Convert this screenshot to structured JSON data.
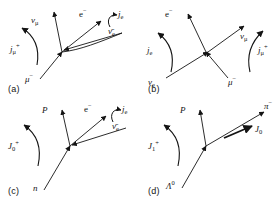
{
  "figure": {
    "type": "physics-feynman-current-diagram-grid",
    "background": "#ffffff",
    "ink": "#141414",
    "panel_count": 4
  },
  "panels": [
    {
      "id": "a",
      "tag": "(a)",
      "current_label": "j",
      "current_sub": "μ",
      "current_sup": "+",
      "labels": [
        {
          "name": "nu-mu",
          "text": "ν",
          "sub": "μ",
          "sup": ""
        },
        {
          "name": "electron",
          "text": "e",
          "sub": "",
          "sup": "−"
        },
        {
          "name": "current-je",
          "text": "j",
          "sub": "e",
          "sup": ""
        },
        {
          "name": "antineutrino",
          "text": "ν̄",
          "sub": "e",
          "sup": ""
        },
        {
          "name": "muon",
          "text": "μ",
          "sub": "",
          "sup": "−"
        }
      ]
    },
    {
      "id": "b",
      "tag": "(b)",
      "current_label": "j",
      "current_sub": "e",
      "current_sup": "",
      "current2_label": "j",
      "current2_sub": "μ",
      "current2_sup": "+",
      "labels": [
        {
          "name": "electron",
          "text": "e",
          "sub": "",
          "sup": "−"
        },
        {
          "name": "nu-mu",
          "text": "ν",
          "sub": "μ",
          "sup": ""
        },
        {
          "name": "nu-e",
          "text": "ν",
          "sub": "e",
          "sup": ""
        },
        {
          "name": "muon",
          "text": "μ",
          "sub": "",
          "sup": "−"
        }
      ]
    },
    {
      "id": "c",
      "tag": "(c)",
      "current_label": "J",
      "current_sub": "0",
      "current_sup": "+",
      "labels": [
        {
          "name": "proton",
          "text": "P",
          "sub": "",
          "sup": ""
        },
        {
          "name": "electron",
          "text": "e",
          "sub": "",
          "sup": "−"
        },
        {
          "name": "current-je",
          "text": "j",
          "sub": "e",
          "sup": ""
        },
        {
          "name": "antineutrino",
          "text": "ν̄",
          "sub": "e",
          "sup": ""
        },
        {
          "name": "neutron",
          "text": "n",
          "sub": "",
          "sup": ""
        }
      ]
    },
    {
      "id": "d",
      "tag": "(d)",
      "current_label": "J",
      "current_sub": "1",
      "current_sup": "+",
      "labels": [
        {
          "name": "proton",
          "text": "P",
          "sub": "",
          "sup": ""
        },
        {
          "name": "pion",
          "text": "π",
          "sub": "",
          "sup": "−"
        },
        {
          "name": "current-J0",
          "text": "J",
          "sub": "0",
          "sup": ""
        },
        {
          "name": "lambda",
          "text": "Λ",
          "sub": "",
          "sup": "0"
        }
      ]
    }
  ],
  "text": {
    "tag_a": "(a)",
    "tag_b": "(b)",
    "tag_c": "(c)",
    "tag_d": "(d)",
    "a_nu_mu": "ν",
    "a_nu_mu_sub": "μ",
    "a_e": "e",
    "a_e_sup": "−",
    "a_je": "j",
    "a_je_sub": "e",
    "a_nubar_e": "ν̄",
    "a_nubar_e_sub": "e",
    "a_mu": "μ",
    "a_mu_sup": "−",
    "a_jmu": "j",
    "a_jmu_sub": "μ",
    "a_jmu_sup": "+",
    "b_e": "e",
    "b_e_sup": "−",
    "b_nu_mu": "ν",
    "b_nu_mu_sub": "μ",
    "b_nu_e": "ν",
    "b_nu_e_sub": "e",
    "b_mu": "μ",
    "b_mu_sup": "−",
    "b_je": "j",
    "b_je_sub": "e",
    "b_jmu": "j",
    "b_jmu_sub": "μ",
    "b_jmu_sup": "+",
    "c_P": "P",
    "c_e": "e",
    "c_e_sup": "−",
    "c_je": "j",
    "c_je_sub": "e",
    "c_nubar_e": "ν̄",
    "c_nubar_e_sub": "e",
    "c_n": "n",
    "c_J0": "J",
    "c_J0_sub": "0",
    "c_J0_sup": "+",
    "d_P": "P",
    "d_pi": "π",
    "d_pi_sup": "−",
    "d_J0": "J",
    "d_J0_sub": "0",
    "d_lambda": "Λ",
    "d_lambda_sup": "0",
    "d_J1": "J",
    "d_J1_sub": "1",
    "d_J1_sup": "+"
  }
}
